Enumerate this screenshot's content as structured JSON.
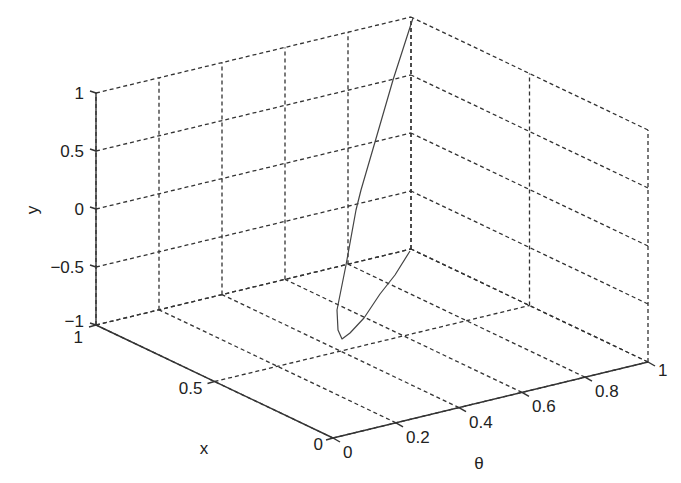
{
  "chart_data": {
    "type": "line3d",
    "title": "",
    "xlabel": "θ",
    "ylabel": "x",
    "zlabel": "y",
    "axes": {
      "theta": {
        "label": "θ",
        "range": [
          0,
          1
        ],
        "ticks": [
          0,
          0.2,
          0.4,
          0.6,
          0.8,
          1
        ],
        "tick_labels": [
          "0",
          "0.2",
          "0.4",
          "0.6",
          "0.8",
          "1"
        ]
      },
      "x": {
        "label": "x",
        "range": [
          0,
          1
        ],
        "ticks": [
          0,
          0.5,
          1
        ],
        "tick_labels": [
          "0",
          "0.5",
          "1"
        ]
      },
      "y": {
        "label": "y",
        "range": [
          -1,
          1
        ],
        "ticks": [
          -1,
          -0.5,
          0,
          0.5,
          1
        ],
        "tick_labels": [
          "−1",
          "−0.5",
          "0",
          "0.5",
          "1"
        ]
      }
    },
    "grid": true,
    "legend": null,
    "series": [
      {
        "name": "trajectory",
        "description": "closed curve lying in the θ=1 plane; starts at (x=1, y=1), dips to y≈-1 near x≈0.3, returns to (x=1, y=-1)",
        "points": [
          {
            "theta": 1,
            "x": 1.0,
            "y": 1.0
          },
          {
            "theta": 1,
            "x": 0.86,
            "y": 0.48
          },
          {
            "theta": 1,
            "x": 0.77,
            "y": 0.05
          },
          {
            "theta": 1,
            "x": 0.72,
            "y": -0.16
          },
          {
            "theta": 1,
            "x": 0.64,
            "y": -0.5
          },
          {
            "theta": 1,
            "x": 0.55,
            "y": -0.75
          },
          {
            "theta": 1,
            "x": 0.44,
            "y": -0.88
          },
          {
            "theta": 1,
            "x": 0.36,
            "y": -0.95
          },
          {
            "theta": 1,
            "x": 0.33,
            "y": -0.97
          },
          {
            "theta": 1,
            "x": 0.36,
            "y": -0.98
          },
          {
            "theta": 1,
            "x": 0.46,
            "y": -0.99
          },
          {
            "theta": 1,
            "x": 0.62,
            "y": -1.0
          },
          {
            "theta": 1,
            "x": 0.82,
            "y": -1.0
          },
          {
            "theta": 1,
            "x": 1.0,
            "y": -1.0
          }
        ],
        "screen_path": [
          [
            413,
            18
          ],
          [
            393,
            80
          ],
          [
            375,
            142
          ],
          [
            361,
            190
          ],
          [
            356,
            210
          ],
          [
            346,
            265
          ],
          [
            337,
            310
          ],
          [
            338,
            330
          ],
          [
            342,
            339
          ],
          [
            350,
            333
          ],
          [
            364,
            318
          ],
          [
            380,
            294
          ],
          [
            395,
            275
          ],
          [
            410,
            251
          ]
        ]
      }
    ]
  },
  "labels": {
    "y_axis": "y",
    "x_axis": "x",
    "theta_axis": "θ"
  }
}
